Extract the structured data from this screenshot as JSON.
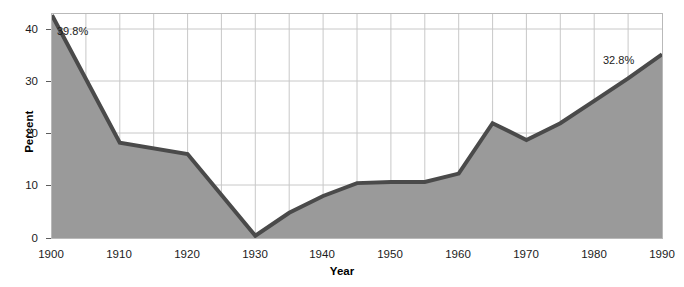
{
  "chart_data": {
    "type": "area",
    "title": "",
    "xlabel": "Year",
    "ylabel": "Percent",
    "xlim": [
      1900,
      1990
    ],
    "ylim": [
      0,
      40
    ],
    "xticks": [
      1900,
      1910,
      1920,
      1930,
      1940,
      1950,
      1960,
      1970,
      1980,
      1990
    ],
    "yticks": [
      0,
      10,
      20,
      30,
      40
    ],
    "grid": true,
    "grid_spacing_x": 5,
    "legend": "none",
    "x": [
      1900,
      1910,
      1920,
      1930,
      1935,
      1940,
      1945,
      1950,
      1955,
      1960,
      1965,
      1970,
      1975,
      1980,
      1985,
      1990
    ],
    "values": [
      39.8,
      17.0,
      15.0,
      0.4,
      4.5,
      7.5,
      9.8,
      10.0,
      10.0,
      11.5,
      20.5,
      17.5,
      20.5,
      24.5,
      28.5,
      32.8
    ],
    "series": [
      {
        "name": "Percent",
        "values": [
          39.8,
          17.0,
          15.0,
          0.4,
          4.5,
          7.5,
          9.8,
          10.0,
          10.0,
          11.5,
          20.5,
          17.5,
          20.5,
          24.5,
          28.5,
          32.8
        ]
      }
    ],
    "annotations": [
      {
        "x": 1900,
        "y": 39.8,
        "text": "39.8%"
      },
      {
        "x": 1990,
        "y": 32.8,
        "text": "32.8%"
      }
    ],
    "colors": {
      "fill": "#9a9a9a",
      "line": "#4a4a4a",
      "grid": "#c8c8c8",
      "frame": "#b9b9b9",
      "text": "#1b1b1b"
    }
  },
  "axes": {
    "y": {
      "title": "Percent",
      "labels": [
        "40",
        "30",
        "20",
        "10",
        "0"
      ]
    },
    "x": {
      "title": "Year",
      "labels": [
        "1900",
        "1910",
        "1920",
        "1930",
        "1940",
        "1950",
        "1960",
        "1970",
        "1980",
        "1990"
      ]
    }
  },
  "annotations": {
    "start": "39.8%",
    "end": "32.8%"
  }
}
